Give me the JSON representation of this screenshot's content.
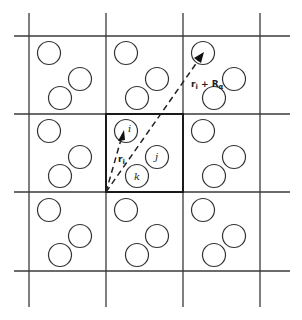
{
  "diagram": {
    "labels": {
      "particle_i": "i",
      "particle_j": "j",
      "particle_k": "k",
      "vector_ri": "r",
      "vector_ri_sub": "i",
      "vector_image": "r",
      "vector_image_sub": "i",
      "vector_image_plus": " + R",
      "vector_image_alpha": "α"
    },
    "colors": {
      "line": "#3a3a3a",
      "background": "#ffffff"
    },
    "grid": {
      "rows": 3,
      "cols": 3,
      "center_cell": "row 2, col 2"
    }
  }
}
